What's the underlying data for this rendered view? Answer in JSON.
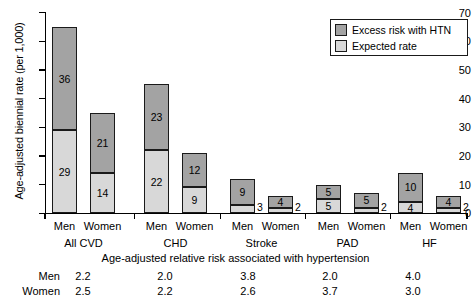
{
  "chart_data": {
    "type": "bar",
    "title": "",
    "xlabel": "",
    "ylabel": "Age-adjusted biennial rate (per 1,000)",
    "ylim": [
      0,
      70
    ],
    "ytick_labels": [
      "0",
      "10",
      "20",
      "30",
      "40",
      "50",
      "60",
      "70"
    ],
    "ytick_values": [
      0,
      10,
      20,
      30,
      40,
      50,
      60,
      70
    ],
    "grid": false,
    "stacked": true,
    "legend_position": "top-right",
    "legend": [
      {
        "label": "Excess risk with HTN",
        "color": "#a3a3a3"
      },
      {
        "label": "Expected rate",
        "color": "#d8d8d8"
      }
    ],
    "series": [
      {
        "name": "Expected rate",
        "color": "#d8d8d8",
        "values": [
          29,
          14,
          22,
          9,
          3,
          2,
          5,
          2,
          4,
          2
        ]
      },
      {
        "name": "Excess risk with HTN",
        "color": "#a3a3a3",
        "values": [
          36,
          21,
          23,
          12,
          9,
          4,
          5,
          5,
          10,
          4
        ]
      }
    ],
    "categories": [
      "All CVD Men",
      "All CVD Women",
      "CHD Men",
      "CHD Women",
      "Stroke Men",
      "Stroke Women",
      "PAD Men",
      "PAD Women",
      "HF Men",
      "HF Women"
    ],
    "groups": [
      {
        "name": "All CVD",
        "sexes": [
          "Men",
          "Women"
        ]
      },
      {
        "name": "CHD",
        "sexes": [
          "Men",
          "Women"
        ]
      },
      {
        "name": "Stroke",
        "sexes": [
          "Men",
          "Women"
        ]
      },
      {
        "name": "PAD",
        "sexes": [
          "Men",
          "Women"
        ]
      },
      {
        "name": "HF",
        "sexes": [
          "Men",
          "Women"
        ]
      }
    ],
    "bars": [
      {
        "group": "All CVD",
        "sex": "Men",
        "expected": 29,
        "excess": 36,
        "total": 65,
        "expected_label_inside": true,
        "excess_label_inside": true
      },
      {
        "group": "All CVD",
        "sex": "Women",
        "expected": 14,
        "excess": 21,
        "total": 35,
        "expected_label_inside": true,
        "excess_label_inside": true
      },
      {
        "group": "CHD",
        "sex": "Men",
        "expected": 22,
        "excess": 23,
        "total": 45,
        "expected_label_inside": true,
        "excess_label_inside": true
      },
      {
        "group": "CHD",
        "sex": "Women",
        "expected": 9,
        "excess": 12,
        "total": 21,
        "expected_label_inside": true,
        "excess_label_inside": true
      },
      {
        "group": "Stroke",
        "sex": "Men",
        "expected": 3,
        "excess": 9,
        "total": 12,
        "expected_label_inside": false,
        "excess_label_inside": true
      },
      {
        "group": "Stroke",
        "sex": "Women",
        "expected": 2,
        "excess": 4,
        "total": 6,
        "expected_label_inside": false,
        "excess_label_inside": true
      },
      {
        "group": "PAD",
        "sex": "Men",
        "expected": 5,
        "excess": 5,
        "total": 10,
        "expected_label_inside": true,
        "excess_label_inside": true
      },
      {
        "group": "PAD",
        "sex": "Women",
        "expected": 2,
        "excess": 5,
        "total": 7,
        "expected_label_inside": false,
        "excess_label_inside": true
      },
      {
        "group": "HF",
        "sex": "Men",
        "expected": 4,
        "excess": 10,
        "total": 14,
        "expected_label_inside": true,
        "excess_label_inside": true
      },
      {
        "group": "HF",
        "sex": "Women",
        "expected": 2,
        "excess": 4,
        "total": 6,
        "expected_label_inside": false,
        "excess_label_inside": true
      }
    ],
    "annotation_table": {
      "caption": "Age-adjusted relative risk associated with hypertension",
      "row_labels": [
        "Men",
        "Women"
      ],
      "column_groups": [
        "All CVD",
        "CHD",
        "Stroke",
        "PAD",
        "HF"
      ],
      "rows": [
        {
          "label": "Men",
          "values": [
            "2.2",
            "2.0",
            "3.8",
            "2.0",
            "4.0"
          ]
        },
        {
          "label": "Women",
          "values": [
            "2.5",
            "2.2",
            "2.6",
            "3.7",
            "3.0"
          ]
        }
      ]
    }
  }
}
